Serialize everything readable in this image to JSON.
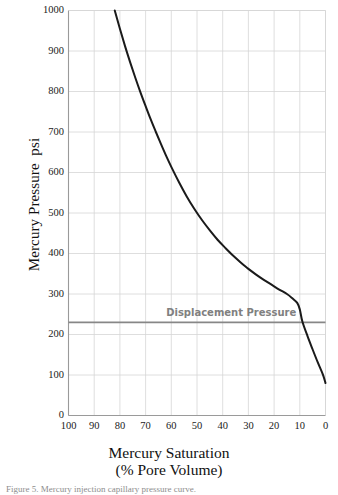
{
  "figure": {
    "caption": "Figure 5. Mercury injection capillary pressure curve."
  },
  "chart_data": {
    "type": "line",
    "title": "",
    "xlabel": "Mercury Saturation",
    "xlabel_line2": "(% Pore Volume)",
    "ylabel": "Mercury Pressure  psi",
    "xlim": [
      100,
      0
    ],
    "ylim": [
      0,
      1000
    ],
    "x_reversed": true,
    "xticks": [
      100,
      90,
      80,
      70,
      60,
      50,
      40,
      30,
      20,
      10,
      0
    ],
    "yticks": [
      0,
      100,
      200,
      300,
      400,
      500,
      600,
      700,
      800,
      900,
      1000
    ],
    "grid": true,
    "legend": "none",
    "series": [
      {
        "name": "Capillary pressure curve",
        "color": "#1a1a1a",
        "x": [
          82,
          80,
          78,
          76,
          74,
          72,
          70,
          68,
          66,
          64,
          62,
          60,
          57,
          54,
          51,
          48,
          45,
          42,
          39,
          36,
          33,
          30,
          27,
          24,
          21,
          18,
          15,
          13,
          11,
          10,
          9,
          7,
          5,
          3,
          1,
          0
        ],
        "y": [
          1000,
          955,
          912,
          872,
          834,
          798,
          764,
          731,
          700,
          670,
          641,
          614,
          576,
          541,
          510,
          482,
          457,
          434,
          414,
          395,
          378,
          362,
          348,
          335,
          323,
          311,
          300,
          290,
          278,
          262,
          232,
          196,
          163,
          131,
          101,
          80
        ]
      }
    ],
    "annotations": [
      {
        "type": "hline",
        "label": "Displacement Pressure",
        "value": 230,
        "color": "#878787",
        "label_color": "#808080",
        "label_x": 62
      }
    ]
  }
}
